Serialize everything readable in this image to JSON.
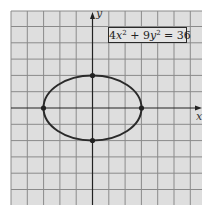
{
  "figure": {
    "equation": {
      "coef_x": "4",
      "var_x": "x",
      "exp_x": "2",
      "plus": " + ",
      "coef_y": "9",
      "var_y": "y",
      "exp_y": "2",
      "rhs": " = 36"
    },
    "x_axis_label": "x",
    "y_axis_label": "y",
    "colors": {
      "grid_background": "#dedede",
      "grid_lines": "#8a8a8a",
      "curve": "#2a2a2a",
      "axes": "#222222"
    },
    "ellipse": {
      "a": 3,
      "b": 2,
      "center": [
        0,
        0
      ]
    },
    "vertices": [
      [
        -3,
        0
      ],
      [
        3,
        0
      ],
      [
        0,
        2
      ],
      [
        0,
        -2
      ]
    ],
    "grid": {
      "x_range": [
        -5,
        6
      ],
      "y_range": [
        -6,
        6
      ],
      "unit": 1
    }
  }
}
